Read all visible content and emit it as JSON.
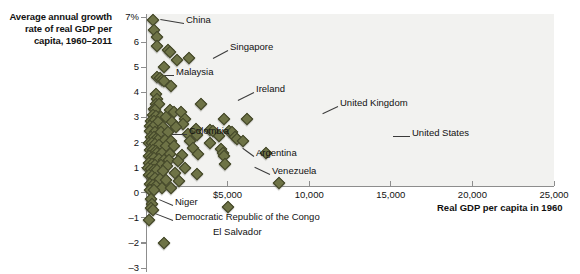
{
  "chart_data": {
    "type": "scatter",
    "title": "",
    "ylabel": "Average annual growth rate of real GDP per capita, 1960–2011",
    "xlabel": "Real GDP per capita in 1960",
    "xlim": [
      0,
      25000
    ],
    "ylim": [
      -3,
      7
    ],
    "grid": false,
    "legend": "none",
    "xticks": [
      {
        "value": 5000,
        "label": "$5,000"
      },
      {
        "value": 10000,
        "label": "10,000"
      },
      {
        "value": 15000,
        "label": "15,000"
      },
      {
        "value": 20000,
        "label": "20,000"
      },
      {
        "value": 25000,
        "label": "25,000"
      }
    ],
    "yticks": [
      {
        "value": 7,
        "label": "7%"
      },
      {
        "value": 6,
        "label": "6"
      },
      {
        "value": 5,
        "label": "5"
      },
      {
        "value": 4,
        "label": "4"
      },
      {
        "value": 3,
        "label": "3"
      },
      {
        "value": 2,
        "label": "2"
      },
      {
        "value": 1,
        "label": "1"
      },
      {
        "value": 0,
        "label": "0"
      },
      {
        "value": -1,
        "label": "–1"
      },
      {
        "value": -2,
        "label": "–2"
      },
      {
        "value": -3,
        "label": "–3"
      }
    ],
    "marker": {
      "shape": "diamond",
      "fill": "#6e7346",
      "stroke": "#3f4226",
      "size": 7
    },
    "points": [
      {
        "x": 450,
        "y": 6.9,
        "label": "China"
      },
      {
        "x": 480,
        "y": 6.5
      },
      {
        "x": 700,
        "y": 6.2
      },
      {
        "x": 690,
        "y": 5.85
      },
      {
        "x": 1350,
        "y": 5.7
      },
      {
        "x": 1480,
        "y": 5.6
      },
      {
        "x": 2650,
        "y": 5.35,
        "label": "Singapore"
      },
      {
        "x": 1900,
        "y": 5.3
      },
      {
        "x": 1100,
        "y": 5.0,
        "label": "Malaysia"
      },
      {
        "x": 700,
        "y": 4.6
      },
      {
        "x": 880,
        "y": 4.55
      },
      {
        "x": 1000,
        "y": 4.5
      },
      {
        "x": 1080,
        "y": 4.45
      },
      {
        "x": 1550,
        "y": 4.25
      },
      {
        "x": 620,
        "y": 3.95
      },
      {
        "x": 700,
        "y": 3.75
      },
      {
        "x": 600,
        "y": 3.55
      },
      {
        "x": 820,
        "y": 3.55
      },
      {
        "x": 3350,
        "y": 3.55,
        "label": "Ireland"
      },
      {
        "x": 480,
        "y": 3.35
      },
      {
        "x": 560,
        "y": 3.3
      },
      {
        "x": 1450,
        "y": 3.3
      },
      {
        "x": 1700,
        "y": 3.2
      },
      {
        "x": 2150,
        "y": 3.2
      },
      {
        "x": 400,
        "y": 3.1
      },
      {
        "x": 620,
        "y": 3.05
      },
      {
        "x": 900,
        "y": 3.0
      },
      {
        "x": 1200,
        "y": 3.0
      },
      {
        "x": 2400,
        "y": 2.95
      },
      {
        "x": 4800,
        "y": 2.95,
        "label": "United Kingdom"
      },
      {
        "x": 320,
        "y": 2.85
      },
      {
        "x": 520,
        "y": 2.85
      },
      {
        "x": 760,
        "y": 2.8
      },
      {
        "x": 1600,
        "y": 2.8
      },
      {
        "x": 2250,
        "y": 2.75
      },
      {
        "x": 6200,
        "y": 2.95
      },
      {
        "x": 250,
        "y": 2.65
      },
      {
        "x": 430,
        "y": 2.6
      },
      {
        "x": 1050,
        "y": 2.6
      },
      {
        "x": 1850,
        "y": 2.6
      },
      {
        "x": 3050,
        "y": 2.55
      },
      {
        "x": 3900,
        "y": 2.5
      },
      {
        "x": 4100,
        "y": 2.45
      },
      {
        "x": 5100,
        "y": 2.45
      },
      {
        "x": 5300,
        "y": 2.4
      },
      {
        "x": 220,
        "y": 2.45
      },
      {
        "x": 560,
        "y": 2.4
      },
      {
        "x": 900,
        "y": 2.4
      },
      {
        "x": 1320,
        "y": 2.4,
        "label": "Colombia"
      },
      {
        "x": 2550,
        "y": 2.35
      },
      {
        "x": 3100,
        "y": 2.3
      },
      {
        "x": 4450,
        "y": 2.25
      },
      {
        "x": 5450,
        "y": 2.2
      },
      {
        "x": 5600,
        "y": 2.15
      },
      {
        "x": 300,
        "y": 2.2
      },
      {
        "x": 480,
        "y": 2.2
      },
      {
        "x": 640,
        "y": 2.15
      },
      {
        "x": 760,
        "y": 2.1
      },
      {
        "x": 1150,
        "y": 2.1
      },
      {
        "x": 1550,
        "y": 2.05
      },
      {
        "x": 2700,
        "y": 2.05
      },
      {
        "x": 3950,
        "y": 2.0
      },
      {
        "x": 5950,
        "y": 2.05,
        "label": "United States"
      },
      {
        "x": 180,
        "y": 2.0
      },
      {
        "x": 360,
        "y": 2.0
      },
      {
        "x": 540,
        "y": 1.95
      },
      {
        "x": 820,
        "y": 1.9
      },
      {
        "x": 1250,
        "y": 1.85
      },
      {
        "x": 1700,
        "y": 1.85
      },
      {
        "x": 2900,
        "y": 1.8
      },
      {
        "x": 4600,
        "y": 1.75
      },
      {
        "x": 4700,
        "y": 1.6
      },
      {
        "x": 4750,
        "y": 1.45
      },
      {
        "x": 240,
        "y": 1.7
      },
      {
        "x": 420,
        "y": 1.7
      },
      {
        "x": 600,
        "y": 1.65
      },
      {
        "x": 700,
        "y": 1.6
      },
      {
        "x": 1000,
        "y": 1.6
      },
      {
        "x": 1500,
        "y": 1.55
      },
      {
        "x": 2200,
        "y": 1.5
      },
      {
        "x": 3200,
        "y": 1.55,
        "label": "Argentina"
      },
      {
        "x": 7350,
        "y": 1.6
      },
      {
        "x": 160,
        "y": 1.45
      },
      {
        "x": 330,
        "y": 1.4
      },
      {
        "x": 520,
        "y": 1.4
      },
      {
        "x": 780,
        "y": 1.35
      },
      {
        "x": 1100,
        "y": 1.3
      },
      {
        "x": 1400,
        "y": 1.3
      },
      {
        "x": 1950,
        "y": 1.25
      },
      {
        "x": 4850,
        "y": 1.15
      },
      {
        "x": 200,
        "y": 1.2
      },
      {
        "x": 380,
        "y": 1.15
      },
      {
        "x": 580,
        "y": 1.1
      },
      {
        "x": 900,
        "y": 1.1
      },
      {
        "x": 1300,
        "y": 1.05
      },
      {
        "x": 2400,
        "y": 1.0
      },
      {
        "x": 150,
        "y": 1.0
      },
      {
        "x": 300,
        "y": 0.95
      },
      {
        "x": 470,
        "y": 0.9
      },
      {
        "x": 680,
        "y": 0.9
      },
      {
        "x": 1050,
        "y": 0.85
      },
      {
        "x": 1750,
        "y": 0.8
      },
      {
        "x": 3150,
        "y": 0.75,
        "label": "Venezuela"
      },
      {
        "x": 180,
        "y": 0.7
      },
      {
        "x": 350,
        "y": 0.65
      },
      {
        "x": 560,
        "y": 0.6
      },
      {
        "x": 860,
        "y": 0.55
      },
      {
        "x": 1250,
        "y": 0.5
      },
      {
        "x": 2050,
        "y": 0.45
      },
      {
        "x": 8150,
        "y": 0.4
      },
      {
        "x": 220,
        "y": 0.35
      },
      {
        "x": 420,
        "y": 0.3
      },
      {
        "x": 640,
        "y": 0.25
      },
      {
        "x": 1000,
        "y": 0.2
      },
      {
        "x": 1550,
        "y": 0.2
      },
      {
        "x": 260,
        "y": 0.1
      },
      {
        "x": 480,
        "y": 0.1
      },
      {
        "x": 330,
        "y": -0.25,
        "label": "Niger"
      },
      {
        "x": 360,
        "y": -0.45
      },
      {
        "x": 310,
        "y": -0.6
      },
      {
        "x": 400,
        "y": -0.7
      },
      {
        "x": 180,
        "y": -1.1,
        "label": "Democratic Republic of the Congo"
      },
      {
        "x": 5000,
        "y": -0.55
      },
      {
        "x": 1100,
        "y": -2.0,
        "label": "El Salvador"
      }
    ],
    "annotations": [
      {
        "text": "China",
        "x": 186,
        "y": 20,
        "lx1": 184,
        "ly1": 23,
        "lx2": 160,
        "ly2": 19
      },
      {
        "text": "Singapore",
        "x": 230,
        "y": 47,
        "lx1": 228,
        "ly1": 50,
        "lx2": 213,
        "ly2": 58
      },
      {
        "text": "Malaysia",
        "x": 176,
        "y": 72,
        "lx1": 174,
        "ly1": 75,
        "lx2": 165,
        "ly2": 75
      },
      {
        "text": "Ireland",
        "x": 256,
        "y": 89,
        "lx1": 254,
        "ly1": 92,
        "lx2": 238,
        "ly2": 100
      },
      {
        "text": "United Kingdom",
        "x": 340,
        "y": 103,
        "lx1": 338,
        "ly1": 106,
        "lx2": 323,
        "ly2": 113
      },
      {
        "text": "Colombia",
        "x": 189,
        "y": 131,
        "lx1": 187,
        "ly1": 134,
        "lx2": 172,
        "ly2": 134
      },
      {
        "text": "United States",
        "x": 412,
        "y": 133,
        "lx1": 410,
        "ly1": 136,
        "lx2": 393,
        "ly2": 136
      },
      {
        "text": "Argentina",
        "x": 256,
        "y": 153,
        "lx1": 254,
        "ly1": 156,
        "lx2": 243,
        "ly2": 148
      },
      {
        "text": "Venezuela",
        "x": 272,
        "y": 171,
        "lx1": 270,
        "ly1": 174,
        "lx2": 255,
        "ly2": 167
      },
      {
        "text": "Niger",
        "x": 175,
        "y": 202,
        "lx1": 173,
        "ly1": 205,
        "lx2": 159,
        "ly2": 199
      },
      {
        "text": "Democratic Republic of the Congo",
        "x": 175,
        "y": 217,
        "lx1": 173,
        "ly1": 220,
        "lx2": 155,
        "ly2": 213
      },
      {
        "text": "El Salvador",
        "x": 213,
        "y": 232,
        "lx1": 0,
        "ly1": 0,
        "lx2": 0,
        "ly2": 0
      }
    ]
  }
}
